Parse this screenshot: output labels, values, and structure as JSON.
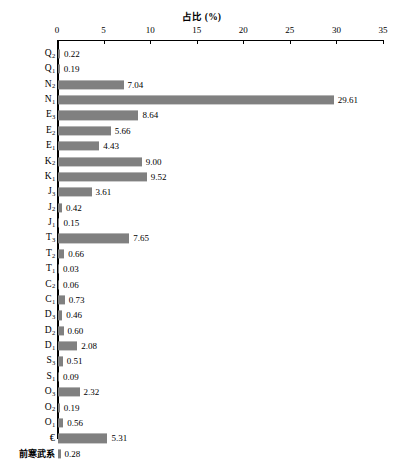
{
  "chart_data": {
    "type": "bar",
    "orientation": "horizontal",
    "title": "占比 (%)",
    "xlabel": "",
    "ylabel": "",
    "xlim": [
      0,
      35
    ],
    "xticks": [
      0,
      5,
      10,
      15,
      20,
      25,
      30,
      35
    ],
    "xtick_labels": [
      "0",
      "5",
      "10",
      "15",
      "20",
      "25",
      "30",
      "35"
    ],
    "grid": false,
    "legend": null,
    "bar_color": "#808080",
    "axis_color": "#000000",
    "value_label_format": "2 decimals, right of bar",
    "categories": [
      "Q₂",
      "Q₁",
      "N₂",
      "N₁",
      "E₃",
      "E₂",
      "E₁",
      "K₂",
      "K₁",
      "J₃",
      "J₂",
      "J₁",
      "T₃",
      "T₂",
      "T₁",
      "C₂",
      "C₁",
      "D₃",
      "D₂",
      "D₁",
      "S₃",
      "S₁",
      "O₃",
      "O₂",
      "O₁",
      "€",
      "前寒武系"
    ],
    "values": [
      0.22,
      0.19,
      7.04,
      29.61,
      8.64,
      5.66,
      4.43,
      9.0,
      9.52,
      3.61,
      0.42,
      0.15,
      7.65,
      0.66,
      0.03,
      0.06,
      0.73,
      0.46,
      0.6,
      2.08,
      0.51,
      0.09,
      2.32,
      0.19,
      0.56,
      5.31,
      0.28
    ],
    "rows": [
      {
        "base": "Q",
        "sub": "2",
        "label": "Q₂",
        "value": 0.22,
        "value_text": "0.22"
      },
      {
        "base": "Q",
        "sub": "1",
        "label": "Q₁",
        "value": 0.19,
        "value_text": "0.19"
      },
      {
        "base": "N",
        "sub": "2",
        "label": "N₂",
        "value": 7.04,
        "value_text": "7.04"
      },
      {
        "base": "N",
        "sub": "1",
        "label": "N₁",
        "value": 29.61,
        "value_text": "29.61"
      },
      {
        "base": "E",
        "sub": "3",
        "label": "E₃",
        "value": 8.64,
        "value_text": "8.64"
      },
      {
        "base": "E",
        "sub": "2",
        "label": "E₂",
        "value": 5.66,
        "value_text": "5.66"
      },
      {
        "base": "E",
        "sub": "1",
        "label": "E₁",
        "value": 4.43,
        "value_text": "4.43"
      },
      {
        "base": "K",
        "sub": "2",
        "label": "K₂",
        "value": 9.0,
        "value_text": "9.00"
      },
      {
        "base": "K",
        "sub": "1",
        "label": "K₁",
        "value": 9.52,
        "value_text": "9.52"
      },
      {
        "base": "J",
        "sub": "3",
        "label": "J₃",
        "value": 3.61,
        "value_text": "3.61"
      },
      {
        "base": "J",
        "sub": "2",
        "label": "J₂",
        "value": 0.42,
        "value_text": "0.42"
      },
      {
        "base": "J",
        "sub": "1",
        "label": "J₁",
        "value": 0.15,
        "value_text": "0.15"
      },
      {
        "base": "T",
        "sub": "3",
        "label": "T₃",
        "value": 7.65,
        "value_text": "7.65"
      },
      {
        "base": "T",
        "sub": "2",
        "label": "T₂",
        "value": 0.66,
        "value_text": "0.66"
      },
      {
        "base": "T",
        "sub": "1",
        "label": "T₁",
        "value": 0.03,
        "value_text": "0.03"
      },
      {
        "base": "C",
        "sub": "2",
        "label": "C₂",
        "value": 0.06,
        "value_text": "0.06"
      },
      {
        "base": "C",
        "sub": "1",
        "label": "C₁",
        "value": 0.73,
        "value_text": "0.73"
      },
      {
        "base": "D",
        "sub": "3",
        "label": "D₃",
        "value": 0.46,
        "value_text": "0.46"
      },
      {
        "base": "D",
        "sub": "2",
        "label": "D₂",
        "value": 0.6,
        "value_text": "0.60"
      },
      {
        "base": "D",
        "sub": "1",
        "label": "D₁",
        "value": 2.08,
        "value_text": "2.08"
      },
      {
        "base": "S",
        "sub": "3",
        "label": "S₃",
        "value": 0.51,
        "value_text": "0.51"
      },
      {
        "base": "S",
        "sub": "1",
        "label": "S₁",
        "value": 0.09,
        "value_text": "0.09"
      },
      {
        "base": "O",
        "sub": "3",
        "label": "O₃",
        "value": 2.32,
        "value_text": "2.32"
      },
      {
        "base": "O",
        "sub": "2",
        "label": "O₂",
        "value": 0.19,
        "value_text": "0.19"
      },
      {
        "base": "O",
        "sub": "1",
        "label": "O₁",
        "value": 0.56,
        "value_text": "0.56"
      },
      {
        "base": "€",
        "sub": "",
        "label": "€",
        "value": 5.31,
        "value_text": "5.31"
      },
      {
        "base": "前寒武系",
        "sub": "",
        "label": "前寒武系",
        "value": 0.28,
        "value_text": "0.28"
      }
    ]
  }
}
